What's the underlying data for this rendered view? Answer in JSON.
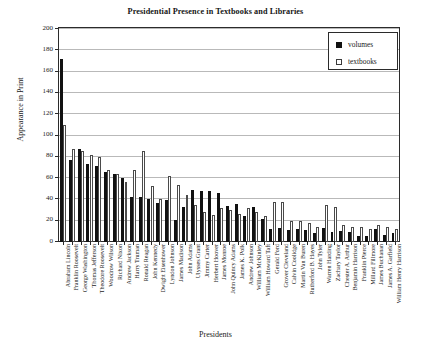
{
  "chart_data": {
    "type": "bar",
    "title": "Presidential Presence in Textbooks and Libraries",
    "xlabel": "Presidents",
    "ylabel": "Appearance in Print",
    "ylim": [
      0,
      200
    ],
    "ytick_step": 20,
    "yticks": [
      200,
      180,
      160,
      140,
      120,
      100,
      80,
      60,
      40,
      20,
      0
    ],
    "grid": true,
    "legend_position": "top-right",
    "categories": [
      "Abraham Lincoln",
      "Franklin Roosevelt",
      "George Washington",
      "Thomas Jefferson",
      "Theodore Roosevelt",
      "Woodrow Wilson",
      "Richard Nixon",
      "Andrew Jackson",
      "Harry Truman",
      "Ronald Reagan",
      "John Kennedy",
      "Dwight Eisenhower",
      "Lyndon Johnson",
      "James Madison",
      "John Adams",
      "Ulysses Grant",
      "Jimmy Carter",
      "Herbert Hoover",
      "James Monroe",
      "John Quincy Adams",
      "James K. Polk",
      "Andrew Johnson",
      "William McKinley",
      "William Howard Taft",
      "Gerald Ford",
      "Grover Cleveland",
      "Calvin Coolidge",
      "Martin Van Buren",
      "Rutherford B. Hayes",
      "John Tyler",
      "Warren Harding",
      "Zachary Taylor",
      "Chester A. Arthur",
      "Benjamin Harrison",
      "Franklin Pierce",
      "Millard Fillmore",
      "James Buchanan",
      "James A. Garfield",
      "William Henry Harrison"
    ],
    "series": [
      {
        "name": "volumes",
        "color": "#111111",
        "values": [
          172,
          77,
          87,
          73,
          71,
          66,
          64,
          60,
          42,
          42,
          40,
          37,
          39,
          21,
          33,
          49,
          48,
          48,
          46,
          34,
          36,
          24,
          33,
          22,
          12,
          13,
          11,
          12,
          11,
          8,
          13,
          9,
          10,
          9,
          6,
          6,
          12,
          7,
          8
        ]
      },
      {
        "name": "textbooks",
        "color": "#ffffff",
        "values": [
          110,
          87,
          85,
          82,
          80,
          68,
          64,
          56,
          68,
          85,
          53,
          40,
          62,
          54,
          44,
          35,
          28,
          25,
          32,
          30,
          26,
          32,
          28,
          24,
          38,
          38,
          20,
          20,
          18,
          14,
          35,
          33,
          16,
          14,
          14,
          12,
          16,
          14,
          12
        ]
      }
    ]
  },
  "legend": {
    "items": [
      {
        "label": "volumes",
        "style": "filled"
      },
      {
        "label": "textbooks",
        "style": "outline"
      }
    ]
  }
}
